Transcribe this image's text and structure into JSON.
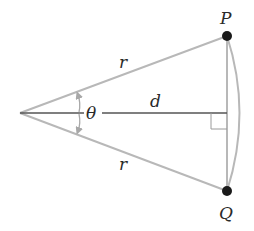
{
  "diagram": {
    "labels": {
      "top_point": "P",
      "bottom_point": "Q",
      "upper_side": "r",
      "lower_side": "r",
      "center_segment": "d",
      "angle": "θ"
    },
    "colors": {
      "sides": "#b8b8b8",
      "center_line": "#555555",
      "points": "#1a1a1a",
      "text": "#2a2a2a",
      "arrows": "#a8a8a8"
    }
  }
}
